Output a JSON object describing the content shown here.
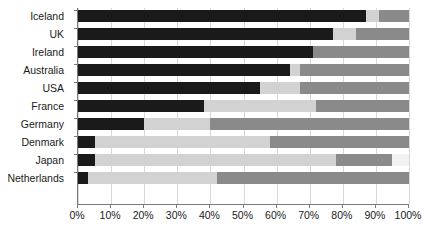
{
  "chart_data": {
    "type": "bar",
    "orientation": "horizontal",
    "stacked": true,
    "percent": true,
    "title": "",
    "xlabel": "",
    "ylabel": "",
    "xlim": [
      0,
      100
    ],
    "grid": true,
    "legend": "none",
    "categories": [
      "Iceland",
      "UK",
      "Ireland",
      "Australia",
      "USA",
      "France",
      "Germany",
      "Denmark",
      "Japan",
      "Netherlands"
    ],
    "tick_labels": [
      "0%",
      "10%",
      "20%",
      "30%",
      "40%",
      "50%",
      "60%",
      "70%",
      "80%",
      "90%",
      "100%"
    ],
    "tick_values": [
      0,
      10,
      20,
      30,
      40,
      50,
      60,
      70,
      80,
      90,
      100
    ],
    "series": [
      {
        "name": "Segment 1",
        "color": "#1a1a1a",
        "values": [
          87,
          77,
          71,
          64,
          55,
          38,
          20,
          5,
          5,
          3
        ]
      },
      {
        "name": "Segment 2",
        "color": "#d2d2d2",
        "values": [
          4,
          7,
          0,
          3,
          12,
          34,
          20,
          53,
          73,
          39
        ]
      },
      {
        "name": "Segment 3",
        "color": "#8a8a8a",
        "values": [
          9,
          16,
          29,
          33,
          33,
          28,
          60,
          42,
          17,
          58
        ]
      },
      {
        "name": "Segment 4",
        "color": "#f2f2f2",
        "values": [
          0,
          0,
          0,
          0,
          0,
          0,
          0,
          0,
          5,
          0
        ]
      }
    ],
    "rows": [
      {
        "category": "Iceland",
        "segments": [
          87,
          4,
          9,
          0
        ]
      },
      {
        "category": "UK",
        "segments": [
          77,
          7,
          16,
          0
        ]
      },
      {
        "category": "Ireland",
        "segments": [
          71,
          0,
          29,
          0
        ]
      },
      {
        "category": "Australia",
        "segments": [
          64,
          3,
          33,
          0
        ]
      },
      {
        "category": "USA",
        "segments": [
          55,
          12,
          33,
          0
        ]
      },
      {
        "category": "France",
        "segments": [
          38,
          34,
          28,
          0
        ]
      },
      {
        "category": "Germany",
        "segments": [
          20,
          20,
          60,
          0
        ]
      },
      {
        "category": "Denmark",
        "segments": [
          5,
          53,
          42,
          0
        ]
      },
      {
        "category": "Japan",
        "segments": [
          5,
          73,
          17,
          5
        ]
      },
      {
        "category": "Netherlands",
        "segments": [
          3,
          39,
          58,
          0
        ]
      }
    ]
  }
}
